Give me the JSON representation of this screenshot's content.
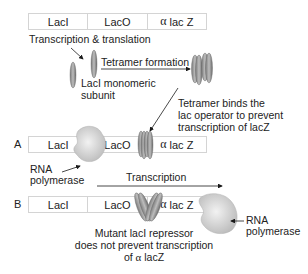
{
  "gene_bar_top": {
    "segments": [
      {
        "label": "LacI"
      },
      {
        "label": "LacO"
      },
      {
        "alpha": "α",
        "label": "lac Z"
      }
    ]
  },
  "labels": {
    "transcription_translation": "Transcription & translation",
    "tetramer_formation": "Tetramer formation",
    "monomeric_line1": "LacI monomeric",
    "monomeric_line2": "subunit",
    "binds_line1": "Tetramer binds the",
    "binds_line2": "lac operator to prevent",
    "binds_line3": "transcription of lacZ",
    "rna_pol_a_line1": "RNA",
    "rna_pol_a_line2": "polymerase",
    "transcription": "Transcription",
    "rna_pol_b_line1": "RNA",
    "rna_pol_b_line2": "polymerase",
    "mutant_line1": "Mutant lacI repressor",
    "mutant_line2": "does not prevent transcription",
    "mutant_line3_prefix": "of ",
    "mutant_line3_alpha": "α",
    "mutant_line3_suffix": " lacZ"
  },
  "row_a": {
    "letter": "A",
    "segments": [
      {
        "label": "LacI"
      },
      {
        "label": "LacO"
      },
      {
        "alpha": "α",
        "label": "lac Z"
      }
    ]
  },
  "row_b": {
    "letter": "B",
    "segments": [
      {
        "label": "LacI"
      },
      {
        "label": "LacO"
      },
      {
        "alpha": "α",
        "label": "lac Z"
      }
    ]
  },
  "colors": {
    "bar_border": "#d4d4d4",
    "protein_fill": "#9a9a9a",
    "protein_dark": "#6e6e6e",
    "polymerase_fill": "#d8d8d8",
    "arrow": "#1a1a1a"
  }
}
